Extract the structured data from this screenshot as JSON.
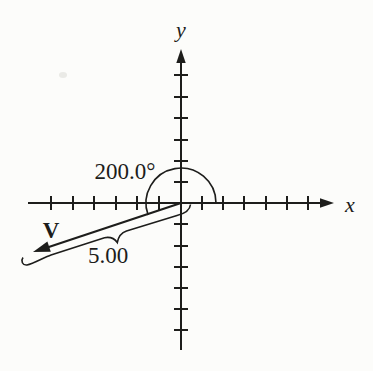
{
  "figure": {
    "type": "vector-diagram",
    "background_color": "#fcfcfa",
    "ink_color": "#1d1d1b",
    "x_axis": {
      "label": "x",
      "ticks_per_side": 6
    },
    "y_axis": {
      "label": "y",
      "ticks_per_side": 6
    },
    "angle_annotation": {
      "label": "200.0°",
      "value_degrees": 200.0
    },
    "vector": {
      "label": "V",
      "direction_degrees": 200.0
    },
    "magnitude_annotation": {
      "label": "5.00",
      "value": 5.0
    }
  }
}
